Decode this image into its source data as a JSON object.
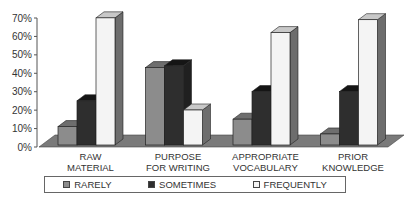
{
  "chart_data": {
    "type": "bar",
    "style": "3d-clustered",
    "title": "",
    "xlabel": "",
    "ylabel": "",
    "ylim": [
      0,
      70
    ],
    "yticks": [
      "0%",
      "10%",
      "20%",
      "30%",
      "40%",
      "50%",
      "60%",
      "70%"
    ],
    "categories": [
      [
        "RAW",
        "MATERIAL"
      ],
      [
        "PURPOSE",
        "FOR WRITING"
      ],
      [
        "APPROPRIATE",
        "VOCABULARY"
      ],
      [
        "PRIOR",
        "KNOWLEDGE"
      ]
    ],
    "series": [
      {
        "name": "RARELY",
        "values": [
          10,
          42,
          14,
          6
        ],
        "color": "#8c8c8c"
      },
      {
        "name": "SOMETIMES",
        "values": [
          24,
          43,
          29,
          29
        ],
        "color": "#2e2e2e"
      },
      {
        "name": "FREQUENTLY",
        "values": [
          69,
          19,
          61,
          68
        ],
        "color": "#f4f4f4"
      }
    ],
    "legend_position": "bottom",
    "grid": false
  }
}
